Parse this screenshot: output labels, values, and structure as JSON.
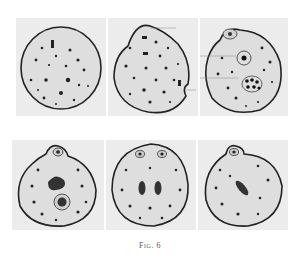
{
  "figure": {
    "caption": "Fig. 6",
    "rows": [
      {
        "panels": [
          {
            "id": "1",
            "description": "round cell with scattered granules"
          },
          {
            "id": "2",
            "description": "cell with bulging outline and granules"
          },
          {
            "id": "3",
            "description": "cell with small nucleus, vacuole and cluster of granules"
          }
        ]
      },
      {
        "panels": [
          {
            "id": "4",
            "description": "cell with apical body, chromatin mass and nucleus"
          },
          {
            "id": "5",
            "description": "cell with two apical bodies and two chromatin masses"
          },
          {
            "id": "6",
            "description": "cell with apical body and elongated chromatin mass"
          }
        ]
      }
    ]
  }
}
